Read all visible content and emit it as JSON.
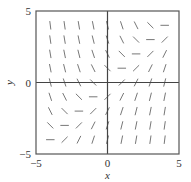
{
  "chart_data": {
    "type": "slope_field",
    "title": "",
    "equation": "dy/dx = x - y",
    "xlabel": "x",
    "ylabel": "y",
    "xlim": [
      -5,
      5
    ],
    "ylim": [
      -5,
      5
    ],
    "x_ticks": [
      {
        "value": -5,
        "label": "−5"
      },
      {
        "value": 0,
        "label": "0"
      },
      {
        "value": 5,
        "label": "5"
      }
    ],
    "y_ticks": [
      {
        "value": -5,
        "label": "−5"
      },
      {
        "value": 0,
        "label": "0"
      },
      {
        "value": 5,
        "label": "5"
      }
    ],
    "grid_x": [
      -4,
      -3,
      -2,
      -1,
      0,
      1,
      2,
      3,
      4
    ],
    "grid_y": [
      -4,
      -3,
      -2,
      -1,
      0,
      1,
      2,
      3,
      4
    ],
    "grid": false,
    "axes_lines": true,
    "legend": null,
    "colors": {
      "frame": "#555555",
      "axes": "#444444",
      "segments": "#777777"
    }
  }
}
